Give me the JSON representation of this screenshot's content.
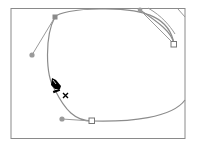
{
  "illustration": {
    "title": "Pen tool adding anchor point to a curved path",
    "tool": "pen-tool",
    "cursor_modifier": "+",
    "colors": {
      "frame": "#8a8a8a",
      "path": "#8c8c8c",
      "handle": "#9a9a9a",
      "anchor_fill": "#ffffff",
      "anchor_stroke": "#777777",
      "cursor": "#000000"
    }
  }
}
